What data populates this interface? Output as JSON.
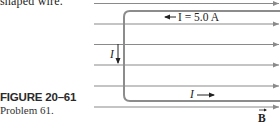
{
  "context_text": "shaped wire.",
  "figure": {
    "label": "FIGURE 20–61",
    "caption": "Problem 61."
  },
  "diagram": {
    "current_label_top": "I = 5.0 A",
    "current_label_left": "I",
    "current_label_bottom": "I",
    "field_label": "B",
    "field_line_color": "#8a8a8a",
    "wire_color": "#8c8c8c",
    "field_line_count": 7
  }
}
